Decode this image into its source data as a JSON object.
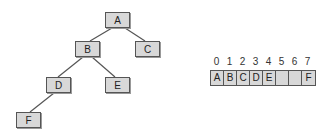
{
  "tree": {
    "nodes": [
      {
        "id": "A",
        "label": "A",
        "x": 105,
        "y": 12
      },
      {
        "id": "B",
        "label": "B",
        "x": 75,
        "y": 41
      },
      {
        "id": "C",
        "label": "C",
        "x": 135,
        "y": 41
      },
      {
        "id": "D",
        "label": "D",
        "x": 46,
        "y": 77
      },
      {
        "id": "E",
        "label": "E",
        "x": 105,
        "y": 77
      },
      {
        "id": "F",
        "label": "F",
        "x": 16,
        "y": 112
      }
    ],
    "edges": [
      [
        "A",
        "B"
      ],
      [
        "A",
        "C"
      ],
      [
        "B",
        "D"
      ],
      [
        "B",
        "E"
      ],
      [
        "D",
        "F"
      ]
    ]
  },
  "array": {
    "indices": [
      "0",
      "1",
      "2",
      "3",
      "4",
      "5",
      "6",
      "7"
    ],
    "cells": [
      "A",
      "B",
      "C",
      "D",
      "E",
      "",
      "",
      "F"
    ]
  }
}
